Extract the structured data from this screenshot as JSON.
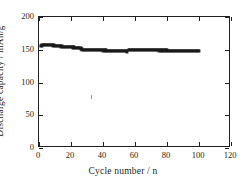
{
  "chart_data": {
    "type": "scatter",
    "title": "",
    "xlabel": "Cycle number / n",
    "ylabel": "Discharge capacity / mAh/g",
    "xlim": [
      0,
      120
    ],
    "ylim": [
      0,
      200
    ],
    "xticks": [
      0,
      20,
      40,
      60,
      80,
      100,
      120
    ],
    "yticks": [
      0,
      50,
      100,
      150,
      200
    ],
    "grid": false,
    "legend": null,
    "marker": "filled-square",
    "marker_color": "#1a1a1a",
    "series": [
      {
        "name": "Discharge capacity",
        "x": [
          1,
          2,
          3,
          4,
          5,
          6,
          7,
          8,
          9,
          10,
          11,
          12,
          13,
          14,
          15,
          16,
          17,
          18,
          19,
          20,
          21,
          22,
          23,
          24,
          25,
          26,
          27,
          28,
          29,
          30,
          31,
          32,
          33,
          34,
          35,
          36,
          37,
          38,
          39,
          40,
          41,
          42,
          43,
          44,
          45,
          46,
          47,
          48,
          49,
          50,
          51,
          52,
          53,
          54,
          55,
          56,
          57,
          58,
          59,
          60,
          61,
          62,
          63,
          64,
          65,
          66,
          67,
          68,
          69,
          70,
          71,
          72,
          73,
          74,
          75,
          76,
          77,
          78,
          79,
          80,
          81,
          82,
          83,
          84,
          85,
          86,
          87,
          88,
          89,
          90,
          91,
          92,
          93,
          94,
          95,
          96,
          97,
          98,
          99,
          100
        ],
        "y": [
          156.0,
          156.5,
          157.0,
          157.2,
          157.3,
          157.2,
          157.0,
          156.8,
          156.5,
          156.2,
          156.0,
          155.7,
          155.4,
          155.1,
          154.9,
          154.7,
          154.5,
          154.3,
          154.1,
          153.9,
          153.7,
          153.6,
          153.4,
          153.3,
          153.2,
          152.0,
          150.5,
          150.3,
          150.2,
          150.1,
          150.0,
          149.9,
          149.8,
          149.7,
          149.6,
          149.5,
          149.4,
          149.3,
          149.2,
          149.1,
          149.0,
          148.9,
          148.8,
          148.7,
          148.6,
          148.5,
          148.4,
          148.3,
          148.2,
          148.1,
          148.0,
          147.9,
          147.8,
          147.7,
          147.6,
          149.8,
          150.0,
          150.0,
          149.9,
          149.9,
          149.8,
          149.8,
          149.7,
          149.7,
          149.6,
          149.6,
          149.5,
          149.5,
          149.4,
          149.4,
          149.3,
          149.3,
          149.2,
          149.2,
          149.1,
          149.1,
          149.0,
          149.0,
          148.9,
          148.9,
          148.8,
          148.8,
          148.7,
          148.7,
          148.6,
          148.6,
          148.5,
          148.5,
          148.4,
          148.4,
          148.3,
          148.3,
          148.2,
          148.2,
          148.1,
          148.1,
          148.0,
          148.0,
          147.9,
          147.8
        ]
      }
    ]
  },
  "axis": {
    "x_title": "Cycle number / n",
    "y_title": "Discharge capacity / mAh/g",
    "x_tick_labels": [
      "0",
      "20",
      "40",
      "60",
      "80",
      "100",
      "120"
    ],
    "y_tick_labels": [
      "0",
      "50",
      "100",
      "150",
      "200"
    ]
  },
  "colors": {
    "axis": "#231f20",
    "marker": "#1a1a1a",
    "background": "#ffffff"
  }
}
